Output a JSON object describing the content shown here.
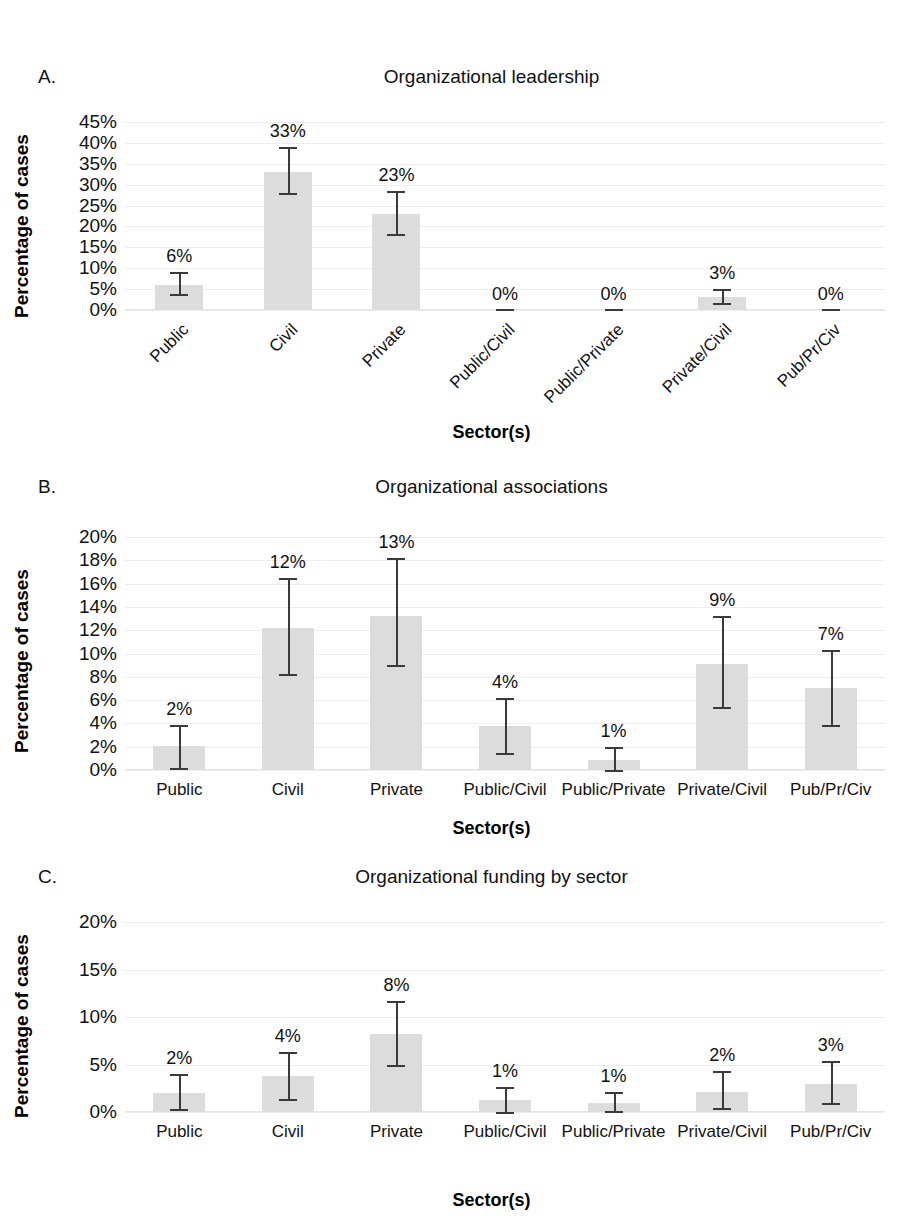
{
  "figure": {
    "background": "#ffffff",
    "bar_color": "#dcdcdc",
    "error_color": "#3a3a3a",
    "grid_color": "#ededed"
  },
  "panels": [
    {
      "letter": "A.",
      "title": "Organizational leadership",
      "ylabel": "Percentage of cases",
      "xlabel": "Sector(s)",
      "xlabel_rotated": true
    },
    {
      "letter": "B.",
      "title": "Organizational associations",
      "ylabel": "Percentage of cases",
      "xlabel": "Sector(s)",
      "xlabel_rotated": false
    },
    {
      "letter": "C.",
      "title": "Organizational funding by sector",
      "ylabel": "Percentage of cases",
      "xlabel": "Sector(s)",
      "xlabel_rotated": false
    }
  ],
  "chart_data": [
    {
      "type": "bar",
      "panel": "A",
      "title": "Organizational leadership",
      "xlabel": "Sector(s)",
      "ylabel": "Percentage of cases",
      "categories": [
        "Public",
        "Civil",
        "Private",
        "Public/Civil",
        "Public/Private",
        "Private/Civil",
        "Pub/Pr/Civ"
      ],
      "values": [
        6,
        33,
        23,
        0,
        0,
        3,
        0
      ],
      "data_labels": [
        "6%",
        "33%",
        "23%",
        "0%",
        "0%",
        "3%",
        "0%"
      ],
      "error_low": [
        3.8,
        28.0,
        18.2,
        0,
        0,
        1.6,
        0
      ],
      "error_high": [
        9.2,
        39.0,
        28.5,
        0,
        0,
        5.0,
        0
      ],
      "ylim": [
        0,
        45
      ],
      "yticks": [
        0,
        5,
        10,
        15,
        20,
        25,
        30,
        35,
        40,
        45
      ],
      "ytick_labels": [
        "0%",
        "5%",
        "10%",
        "15%",
        "20%",
        "25%",
        "30%",
        "35%",
        "40%",
        "45%"
      ],
      "grid": true,
      "legend": "none"
    },
    {
      "type": "bar",
      "panel": "B",
      "title": "Organizational associations",
      "xlabel": "Sector(s)",
      "ylabel": "Percentage of cases",
      "categories": [
        "Public",
        "Civil",
        "Private",
        "Public/Civil",
        "Public/Private",
        "Private/Civil",
        "Pub/Pr/Civ"
      ],
      "values": [
        2.1,
        12.2,
        13.2,
        3.8,
        0.9,
        9.1,
        7.0
      ],
      "data_labels": [
        "2%",
        "12%",
        "13%",
        "4%",
        "1%",
        "9%",
        "7%"
      ],
      "error_low": [
        0.2,
        8.2,
        9.0,
        1.5,
        0.0,
        5.4,
        3.9
      ],
      "error_high": [
        3.9,
        16.5,
        18.2,
        6.2,
        2.0,
        13.2,
        10.3
      ],
      "ylim": [
        0,
        20
      ],
      "yticks": [
        0,
        2,
        4,
        6,
        8,
        10,
        12,
        14,
        16,
        18,
        20
      ],
      "ytick_labels": [
        "0%",
        "2%",
        "4%",
        "6%",
        "8%",
        "10%",
        "12%",
        "14%",
        "16%",
        "18%",
        "20%"
      ],
      "grid": true,
      "legend": "none"
    },
    {
      "type": "bar",
      "panel": "C",
      "title": "Organizational funding by sector",
      "xlabel": "Sector(s)",
      "ylabel": "Percentage of cases",
      "categories": [
        "Public",
        "Civil",
        "Private",
        "Public/Civil",
        "Public/Private",
        "Private/Civil",
        "Pub/Pr/Civ"
      ],
      "values": [
        2.0,
        3.8,
        8.2,
        1.3,
        1.0,
        2.1,
        3.0
      ],
      "data_labels": [
        "2%",
        "4%",
        "8%",
        "1%",
        "1%",
        "2%",
        "3%"
      ],
      "error_low": [
        0.3,
        1.4,
        4.9,
        0.0,
        0.1,
        0.4,
        0.9
      ],
      "error_high": [
        4.0,
        6.3,
        11.7,
        2.6,
        2.1,
        4.3,
        5.4
      ],
      "ylim": [
        0,
        20
      ],
      "yticks": [
        0,
        5,
        10,
        15,
        20
      ],
      "ytick_labels": [
        "0%",
        "5%",
        "10%",
        "15%",
        "20%"
      ],
      "grid": true,
      "legend": "none"
    }
  ]
}
